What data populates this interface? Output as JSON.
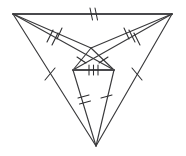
{
  "figure": {
    "canvas": {
      "width": 186,
      "height": 156
    },
    "background_color": "#ffffff",
    "line_color": "#3a3a3c",
    "tick_color": "#2e2e30",
    "vertices": {
      "top_left": {
        "label": "A",
        "x": 13,
        "y": 14
      },
      "top_right": {
        "label": "B",
        "x": 172,
        "y": 14
      },
      "bottom": {
        "label": "C",
        "x": 96,
        "y": 146
      },
      "inner_top": {
        "label": "D",
        "x": 91,
        "y": 48
      },
      "inner_left": {
        "label": "E",
        "x": 73,
        "y": 70
      },
      "inner_right": {
        "label": "F",
        "x": 114,
        "y": 70
      }
    },
    "segments": [
      {
        "name": "top-edge",
        "from": "top_left",
        "to": "top_right",
        "ticks": 2,
        "weight": "heavy"
      },
      {
        "name": "left-to-inner-top",
        "from": "top_left",
        "to": "inner_top",
        "ticks": 1
      },
      {
        "name": "right-to-inner-top",
        "from": "top_right",
        "to": "inner_top",
        "ticks": 1
      },
      {
        "name": "left-to-inner-right",
        "from": "top_left",
        "to": "inner_right",
        "ticks": 2
      },
      {
        "name": "right-to-inner-left",
        "from": "top_right",
        "to": "inner_left",
        "ticks": 2
      },
      {
        "name": "left-to-bottom",
        "from": "top_left",
        "to": "bottom",
        "ticks": 1
      },
      {
        "name": "right-to-bottom",
        "from": "top_right",
        "to": "bottom",
        "ticks": 1
      },
      {
        "name": "inner-top-to-inner-left",
        "from": "inner_top",
        "to": "inner_left",
        "ticks": 1
      },
      {
        "name": "inner-top-to-inner-right",
        "from": "inner_top",
        "to": "inner_right",
        "ticks": 1
      },
      {
        "name": "inner-crossbar",
        "from": "inner_left",
        "to": "inner_right",
        "ticks": 3,
        "weight": "heavy"
      },
      {
        "name": "inner-left-to-bottom",
        "from": "inner_left",
        "to": "bottom",
        "ticks": 2
      },
      {
        "name": "inner-right-to-bottom",
        "from": "inner_right",
        "to": "bottom",
        "ticks": 1
      }
    ],
    "tick_legend": {
      "single": "one hatch mark",
      "double": "two hatch marks",
      "triple": "three hatch marks"
    }
  }
}
